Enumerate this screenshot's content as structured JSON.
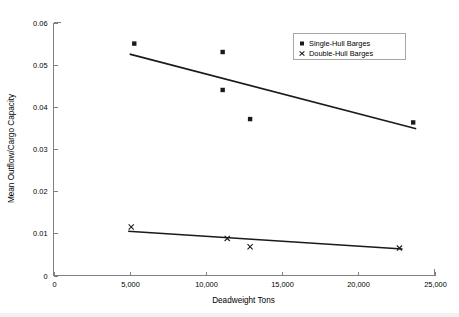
{
  "chart_data": {
    "type": "scatter",
    "title": "",
    "xlabel": "Deadweight Tons",
    "ylabel": "Mean Outflow/Cargo Capacity",
    "xlim": [
      0,
      25000
    ],
    "ylim": [
      0,
      0.06
    ],
    "grid": false,
    "legend_position": "top-right",
    "x_ticks": [
      0,
      5000,
      10000,
      15000,
      20000,
      25000
    ],
    "x_tick_labels": [
      "0",
      "5,000",
      "10,000",
      "15,000",
      "20,000",
      "25,000"
    ],
    "y_ticks": [
      0,
      0.01,
      0.02,
      0.03,
      0.04,
      0.05,
      0.06
    ],
    "y_tick_labels": [
      "0",
      "0.01",
      "0.02",
      "0.03",
      "0.04",
      "0.05",
      "0.06"
    ],
    "series": [
      {
        "name": "Single-Hull Barges",
        "marker": "square",
        "color": "#1a1a1a",
        "points": [
          {
            "x": 5300,
            "y": 0.055
          },
          {
            "x": 11100,
            "y": 0.053
          },
          {
            "x": 11100,
            "y": 0.044
          },
          {
            "x": 12900,
            "y": 0.0371
          },
          {
            "x": 23600,
            "y": 0.0363
          }
        ],
        "trendline": {
          "x1": 5000,
          "y1": 0.0525,
          "x2": 23800,
          "y2": 0.0348
        }
      },
      {
        "name": "Double-Hull Barges",
        "marker": "x",
        "color": "#1a1a1a",
        "points": [
          {
            "x": 5100,
            "y": 0.0115
          },
          {
            "x": 11400,
            "y": 0.0088
          },
          {
            "x": 12900,
            "y": 0.0068
          },
          {
            "x": 22700,
            "y": 0.0065
          }
        ],
        "trendline": {
          "x1": 4900,
          "y1": 0.0105,
          "x2": 22900,
          "y2": 0.0063
        }
      }
    ]
  },
  "legend": {
    "items": [
      {
        "label": "Single-Hull Barges",
        "marker": "square"
      },
      {
        "label": "Double-Hull Barges",
        "marker": "x"
      }
    ]
  },
  "axes": {
    "x_title": "Deadweight Tons",
    "y_title": "Mean Outflow/Cargo Capacity"
  }
}
